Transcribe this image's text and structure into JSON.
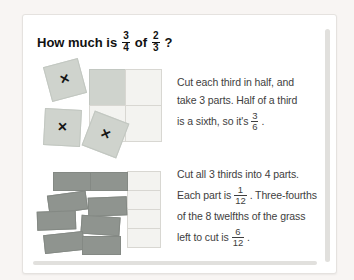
{
  "colors": {
    "page_bg": "#f8f5f3",
    "card_bg": "#ffffff",
    "card_border": "#e5e2df",
    "tile_green": "#cfd3cd",
    "tile_green_border": "#c2c7c1",
    "cell_bg": "#f3f3f0",
    "cell_border": "#d8d7d2",
    "shaded_cell": "#cfd3cd",
    "rect_dark": "#8f948f",
    "rect_dark_border": "#848984",
    "edge_shadow": "#e1e0dd",
    "text": "#3e3e3e",
    "title_text": "#111111"
  },
  "title": {
    "prefix": "How much is",
    "fraction1": {
      "numerator": "3",
      "denominator": "4"
    },
    "connector": "of",
    "fraction2": {
      "numerator": "2",
      "denominator": "3"
    },
    "suffix": "?"
  },
  "step1": {
    "line1": "Cut each third in half, and",
    "line2": "take 3 parts. Half of a third",
    "line3_prefix": "is a sixth, so it's",
    "fraction": {
      "numerator": "3",
      "denominator": "6"
    },
    "line3_suffix": "."
  },
  "step2": {
    "line1": "Cut all 3 thirds into 4 parts.",
    "line2_prefix": "Each part is",
    "fraction1": {
      "numerator": "1",
      "denominator": "12"
    },
    "line2_suffix": ". Three-fourths",
    "line3": "of the 8 twelfths of the grass",
    "line4_prefix": "left to cut is",
    "fraction2": {
      "numerator": "6",
      "denominator": "12"
    },
    "line4_suffix": "."
  },
  "figure1": {
    "cross_mark": "×",
    "crossed_tiles_count": 3,
    "grid": {
      "rows": 2,
      "cols": 2,
      "shaded_cells": 1
    }
  },
  "figure2": {
    "dark_rects_count": 8,
    "column_cells_count": 4
  }
}
